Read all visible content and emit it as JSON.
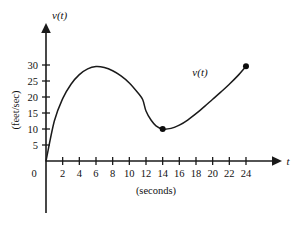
{
  "chart_data": {
    "type": "line",
    "title": "",
    "xlabel": "(seconds)",
    "ylabel": "(feet/sec)",
    "x_axis_name": "t",
    "y_axis_name": "v(t)",
    "curve_label": "v(t)",
    "xlim": [
      0,
      26
    ],
    "ylim": [
      0,
      33
    ],
    "grid": false,
    "legend_position": "none",
    "x_ticks": [
      0,
      2,
      4,
      6,
      8,
      10,
      12,
      14,
      16,
      18,
      20,
      22,
      24
    ],
    "x_tick_labels": [
      "0",
      "2",
      "4",
      "6",
      "8",
      "10",
      "12",
      "14",
      "16",
      "18",
      "20",
      "22",
      "24"
    ],
    "y_ticks": [
      5,
      10,
      15,
      20,
      25,
      30
    ],
    "y_tick_labels": [
      "5",
      "10",
      "15",
      "20",
      "25",
      "30"
    ],
    "series": [
      {
        "name": "v(t)",
        "x": [
          0,
          1,
          2,
          3,
          4,
          5,
          6,
          7,
          8,
          9,
          10,
          11,
          11.6,
          12,
          12.6,
          13.2,
          14,
          15,
          16,
          17,
          18,
          19,
          20,
          21,
          22,
          23,
          24
        ],
        "y": [
          0,
          12.5,
          19.5,
          24.0,
          27.0,
          28.8,
          29.5,
          29.2,
          28.2,
          26.6,
          24.4,
          21.4,
          19.2,
          15.6,
          12.8,
          11.0,
          10.0,
          10.2,
          11.2,
          12.8,
          14.8,
          17.0,
          19.3,
          21.6,
          24.0,
          26.6,
          29.6
        ]
      }
    ],
    "marked_points": [
      {
        "label": "minimum",
        "x": 14,
        "y": 10
      },
      {
        "label": "endpoint",
        "x": 24,
        "y": 29.6
      }
    ],
    "colors": {
      "curve": "#1a1a1a",
      "axis": "#1a1a1a",
      "text": "#111111",
      "background": "#ffffff"
    }
  }
}
